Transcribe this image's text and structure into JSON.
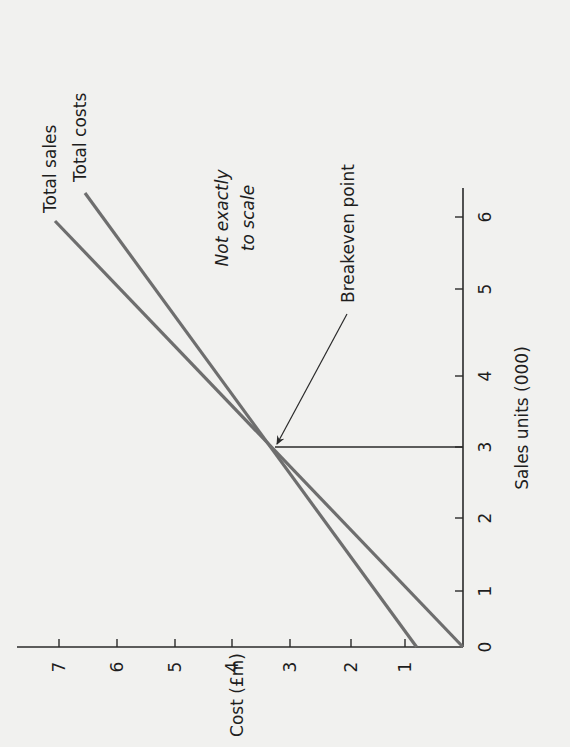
{
  "chart_data": {
    "type": "line",
    "orientation": "rotated 90° clockwise on page",
    "title": "",
    "xlabel": "Sales units (000)",
    "ylabel": "Cost (£m)",
    "x_ticks": [
      "0",
      "1",
      "2",
      "3",
      "4",
      "5",
      "6"
    ],
    "y_ticks": [
      "1",
      "2",
      "3",
      "4",
      "5",
      "6",
      "7"
    ],
    "xlim": [
      0,
      6.4
    ],
    "ylim": [
      0,
      7.7
    ],
    "grid": false,
    "legend": "inline labels at line ends",
    "series": [
      {
        "name": "Total sales",
        "x": [
          0,
          1,
          2,
          3,
          4,
          5,
          6
        ],
        "values": [
          0,
          1.1,
          2.2,
          3.3,
          4.4,
          5.5,
          6.6
        ],
        "end_label": "Total sales"
      },
      {
        "name": "Total costs",
        "x": [
          0,
          1,
          2,
          3,
          4,
          5,
          6
        ],
        "values": [
          0.8,
          1.6,
          2.45,
          3.3,
          4.15,
          5.0,
          5.85
        ],
        "end_label": "Total costs"
      }
    ],
    "annotations": [
      {
        "text": "Breakeven point",
        "x": 3,
        "y": 3.3,
        "arrow": true
      },
      {
        "text_lines": [
          "Not exactly",
          "to scale"
        ],
        "italic": true
      }
    ],
    "breakeven": {
      "x": 3,
      "y": 3.3
    }
  }
}
